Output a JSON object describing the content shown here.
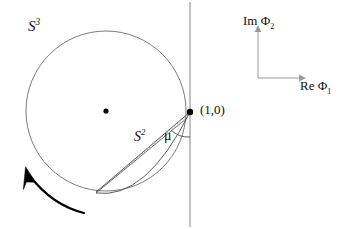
{
  "figure": {
    "background_color": "#ffffff",
    "width": 351,
    "height": 229
  },
  "labels": {
    "s3": {
      "base": "S",
      "exponent": "3",
      "text": "S³"
    },
    "s2": {
      "base": "S",
      "exponent": "2",
      "text": "S²"
    },
    "mu": {
      "text": "μ"
    },
    "point": {
      "text": "(1,0)"
    },
    "axis_vertical": {
      "prefix": "Im ",
      "symbol": "Φ",
      "subscript": "2",
      "text": "Im Φ₂"
    },
    "axis_horizontal": {
      "prefix": "Re ",
      "symbol": "Φ",
      "subscript": "1",
      "text": "Re Φ₁"
    }
  },
  "geometry": {
    "circle": {
      "cx": 106,
      "cy": 111,
      "r": 80,
      "stroke": "#6b6b6b",
      "stroke_width": 0.9
    },
    "center_dot": {
      "cx": 106,
      "cy": 111,
      "r": 2.6,
      "fill": "#000000"
    },
    "marked_point": {
      "cx": 190,
      "cy": 112,
      "r": 3.2,
      "fill": "#000000",
      "value": "(1,0)"
    },
    "vertical_line": {
      "x": 190,
      "y1": 2,
      "y2": 227,
      "stroke": "#8f8f8f",
      "stroke_width": 1.1
    },
    "lens": {
      "apex_top": {
        "x": 190,
        "y": 112
      },
      "apex_bottom": {
        "x": 96,
        "y": 192
      },
      "stroke": "#4a4a4a",
      "dotted_stroke": "#9a9a9a"
    },
    "mu_arc": {
      "center_x": 190,
      "center_y": 112,
      "radius": 24,
      "stroke": "#4a4a4a"
    },
    "rotation_arrow": {
      "direction": "counter-clockwise",
      "stroke": "#000000",
      "stroke_width": 2.1,
      "tip": {
        "x": 25,
        "y": 172
      },
      "tail": {
        "x": 84,
        "y": 213
      }
    },
    "axes": {
      "origin": {
        "x": 258,
        "y": 78
      },
      "vertical_top": {
        "x": 258,
        "y": 27
      },
      "horizontal_right": {
        "x": 306,
        "y": 78
      },
      "stroke": "#9a9a9a",
      "stroke_width": 1.0
    }
  },
  "colors": {
    "ink": "#111111",
    "circle_line": "#6b6b6b",
    "axis_line": "#9a9a9a",
    "accent_dot": "#000000",
    "dotted": "#9a9a9a"
  }
}
